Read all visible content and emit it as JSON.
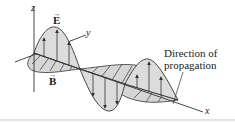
{
  "figure": {
    "labels": {
      "z_axis": "z",
      "y_axis": "y",
      "x_axis": "x",
      "electric_field": "E",
      "magnetic_field": "B",
      "vector_arrow": "→",
      "direction_line1": "Direction of",
      "direction_line2": "propagation"
    },
    "colors": {
      "stroke": "#333333",
      "fill": "#dcdcdc",
      "background": "#ffffff",
      "rule": "#e2e2e2"
    }
  }
}
